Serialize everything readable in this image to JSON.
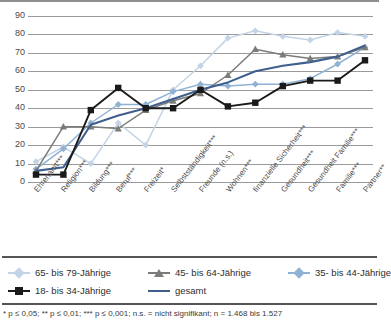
{
  "chart_data": {
    "type": "line",
    "title": "",
    "subtitle": "",
    "xlabel": "",
    "ylabel": "",
    "ylim": [
      0,
      90
    ],
    "yticks": [
      0,
      10,
      20,
      30,
      40,
      50,
      60,
      70,
      80,
      90
    ],
    "grid": true,
    "legend_position": "bottom",
    "categories": [
      "Ehrenamt***",
      "Religion***",
      "Bildung***",
      "Beruf***",
      "Freizeit*",
      "Selbstständigkeit***",
      "Freunde (n.s.)",
      "Wohnen***",
      "finanzielle Sicherheit***",
      "Gesundheit***",
      "Gesundheit Familie***",
      "Familie***",
      "Partner**"
    ],
    "series": [
      {
        "name": "65- bis 79-Jährige",
        "color": "#c3d4e6",
        "marker": "diamond",
        "values": [
          11,
          19,
          10,
          32,
          20,
          50,
          63,
          78,
          82,
          79,
          77,
          81,
          79
        ]
      },
      {
        "name": "45- bis 64-Jährige",
        "color": "#7b7b78",
        "marker": "triangle",
        "values": [
          6,
          30,
          30,
          29,
          39,
          44,
          48,
          58,
          72,
          69,
          67,
          68,
          73
        ]
      },
      {
        "name": "35- bis 44-Jährige",
        "color": "#8fb2d4",
        "marker": "diamond",
        "values": [
          7,
          18,
          32,
          42,
          42,
          49,
          53,
          52,
          53,
          53,
          56,
          64,
          73
        ]
      },
      {
        "name": "18- bis 34-Jährige",
        "color": "#1a1a1a",
        "marker": "square",
        "values": [
          4,
          4,
          39,
          51,
          40,
          40,
          50,
          41,
          43,
          52,
          55,
          55,
          66
        ]
      },
      {
        "name": "gesamt",
        "color": "#3f5f8f",
        "marker": "none",
        "values": [
          6,
          8,
          31,
          36,
          40,
          45,
          50,
          54,
          60,
          63,
          65,
          68,
          74
        ]
      }
    ]
  },
  "legend": {
    "items": [
      {
        "label": "65- bis 79-Jährige",
        "color": "#c3d4e6",
        "marker": "diamond"
      },
      {
        "label": "45- bis 64-Jährige",
        "color": "#7b7b78",
        "marker": "triangle"
      },
      {
        "label": "35- bis 44-Jährige",
        "color": "#8fb2d4",
        "marker": "diamond"
      },
      {
        "label": "18- bis 34-Jährige",
        "color": "#1a1a1a",
        "marker": "square"
      },
      {
        "label": "gesamt",
        "color": "#3f5f8f",
        "marker": "none"
      }
    ]
  },
  "footnote": {
    "text": "* p ≤ 0,05; ** p ≤ 0,01; *** p ≤ 0,001; n.s. = nicht signifikant; n = 1.468 bis 1.527"
  }
}
